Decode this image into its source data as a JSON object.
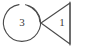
{
  "canvas": {
    "width": 89,
    "height": 47,
    "background": "#ffffff",
    "stroke_color": "#4a4a4a",
    "label_color": "#3a3a3a"
  },
  "shapes": [
    {
      "name": "circle-node",
      "kind": "circle",
      "label": "3",
      "center_x": 22,
      "center_y": 23,
      "radius": 18.5,
      "gap_top": true
    },
    {
      "name": "triangle-node",
      "kind": "triangle",
      "label": "1",
      "apex_x": 41,
      "apex_y": 23,
      "top_x": 70,
      "top_y": 3,
      "bottom_x": 70,
      "bottom_y": 44
    },
    {
      "name": "right-vertical-bar",
      "kind": "line",
      "x": 70,
      "y_start": 2,
      "y_end": 45
    }
  ],
  "labels": {
    "circle_value": "3",
    "triangle_value": "1"
  }
}
